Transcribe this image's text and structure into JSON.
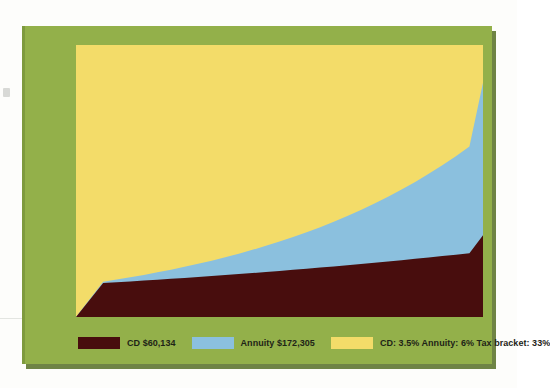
{
  "chart_data": {
    "type": "area",
    "title": "",
    "xlabel": "",
    "ylabel": "",
    "xlim": [
      0,
      30
    ],
    "ylim": [
      0,
      200000
    ],
    "grid": false,
    "stacked": false,
    "legend_position": "bottom",
    "x_ticks": [
      "0",
      "5",
      "10",
      "15",
      "20",
      "25",
      "30"
    ],
    "x_tick_values": [
      0,
      5,
      10,
      15,
      20,
      25,
      30
    ],
    "y_ticks": [
      "0",
      "50,000",
      "100,000",
      "150,000",
      "$200,000"
    ],
    "y_tick_values": [
      0,
      50000,
      100000,
      150000,
      200000
    ],
    "x": [
      0,
      1,
      2,
      3,
      4,
      5,
      6,
      7,
      8,
      9,
      10,
      11,
      12,
      13,
      14,
      15,
      16,
      17,
      18,
      19,
      20,
      21,
      22,
      23,
      24,
      25,
      26,
      27,
      28,
      29,
      30
    ],
    "series": [
      {
        "name": "CD",
        "color": "#480d0d",
        "final_value": 60134,
        "values": [
          0,
          12500,
          25000,
          25590,
          26194,
          26812,
          27445,
          28093,
          28756,
          29435,
          30130,
          30841,
          31569,
          32314,
          33077,
          33858,
          34657,
          35475,
          36313,
          37170,
          38047,
          38945,
          39864,
          40805,
          41768,
          42754,
          43763,
          44796,
          45853,
          46935,
          60134
        ]
      },
      {
        "name": "Annuity",
        "color": "#8bc0de",
        "final_value": 172305,
        "values": [
          0,
          13000,
          26000,
          27560,
          29214,
          30967,
          32825,
          34794,
          36882,
          39095,
          41441,
          43927,
          46563,
          49357,
          52318,
          55457,
          58785,
          62312,
          66051,
          70014,
          74215,
          78668,
          83388,
          88391,
          93695,
          99316,
          105276,
          111592,
          118288,
          125385,
          172305
        ]
      }
    ],
    "background_band": {
      "name": "Assumptions",
      "color": "#f3dc69"
    },
    "legend": [
      {
        "key": "cd",
        "label": "CD $60,134",
        "color": "#480d0d"
      },
      {
        "key": "annuity",
        "label": "Annuity $172,305",
        "color": "#8bc0de"
      },
      {
        "key": "notes",
        "label": "CD: 3.5% Annuity: 6% Tax bracket: 33%",
        "color": "#f3dc69"
      }
    ]
  },
  "colors": {
    "card_background": "#93b04a",
    "card_shadow": "#566e24",
    "plot_background": "#f3dc69",
    "cd_area": "#480d0d",
    "annuity_area": "#8bc0de",
    "axis_text": "#23281a",
    "page_background": "#fdfdfb"
  }
}
